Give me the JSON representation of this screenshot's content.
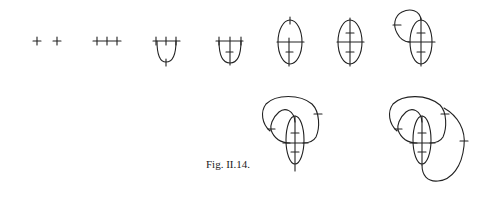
{
  "figure": {
    "caption": "Fig. II.14.",
    "stroke_color": "#222222",
    "panels": [
      {
        "id": 1,
        "description": "two separate crossings"
      },
      {
        "id": 2,
        "description": "three crossings on a horizontal line"
      },
      {
        "id": 3,
        "description": "three crossings joined by a U-shaped arc with a crossing at its bottom"
      },
      {
        "id": 4,
        "description": "U-shaped arc with central vertical line and inner crossing"
      },
      {
        "id": 5,
        "description": "oval with horizontal and vertical chords and crossings"
      },
      {
        "id": 6,
        "description": "oval with vertical chord carrying three crossings"
      },
      {
        "id": 7,
        "description": "oval with extra loop to the left"
      },
      {
        "id": 8,
        "description": "oval with two nested loops"
      },
      {
        "id": 9,
        "description": "oval with nested loops and outer loop on the right"
      }
    ]
  }
}
